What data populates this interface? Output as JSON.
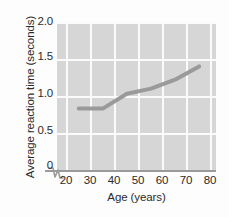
{
  "chart_data": {
    "type": "line",
    "title": "",
    "xlabel": "Age (years)",
    "ylabel": "Average reaction time (seconds)",
    "xlim": [
      16,
      82
    ],
    "ylim": [
      0,
      2.1
    ],
    "xticks": [
      "20",
      "30",
      "40",
      "50",
      "60",
      "70",
      "80"
    ],
    "yticks": [
      "0",
      "0.5",
      "1.0",
      "1.5",
      "2.0"
    ],
    "grid": true,
    "legend": "none",
    "axis_break": "y-axis break between 0 and first gridline",
    "x": [
      25,
      35,
      45,
      55,
      65,
      75
    ],
    "values": [
      0.93,
      0.93,
      1.13,
      1.2,
      1.32,
      1.5
    ],
    "series": [
      {
        "name": "Average reaction time",
        "color": "#9a9a9a",
        "x": [
          25,
          35,
          45,
          55,
          65,
          75
        ],
        "values": [
          0.93,
          0.93,
          1.13,
          1.2,
          1.32,
          1.5
        ]
      }
    ]
  },
  "style": {
    "panel_background": "#d6d6d6",
    "gridline_color": "#fbfbfb",
    "axis_color": "#9a9a9a",
    "line_color": "#9a9a9a",
    "text_color": "#2b2b2b",
    "page_background": "#fdfdfd"
  }
}
